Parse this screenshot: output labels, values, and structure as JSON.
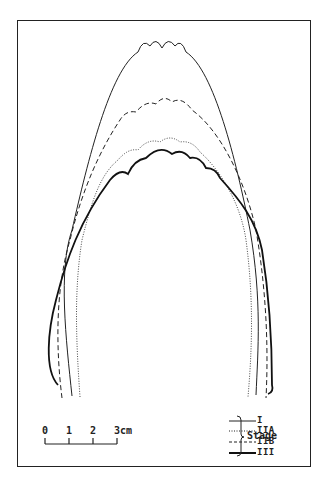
{
  "figure": {
    "type": "overlaid outline tracings of arch shapes by stage",
    "series": [
      {
        "key": "I",
        "label": "I",
        "line_style": "solid-thin"
      },
      {
        "key": "IIA",
        "label": "IIA",
        "line_style": "dotted"
      },
      {
        "key": "IIB",
        "label": "IIB",
        "line_style": "dashed"
      },
      {
        "key": "III",
        "label": "III",
        "line_style": "solid-thick"
      }
    ],
    "legend": {
      "group_label": "Stage",
      "items": [
        "I",
        "IIA",
        "IIB",
        "III"
      ]
    },
    "scale_bar": {
      "ticks": [
        "0",
        "1",
        "2",
        "3"
      ],
      "unit": "cm",
      "last_tick_label": "3cm"
    }
  }
}
